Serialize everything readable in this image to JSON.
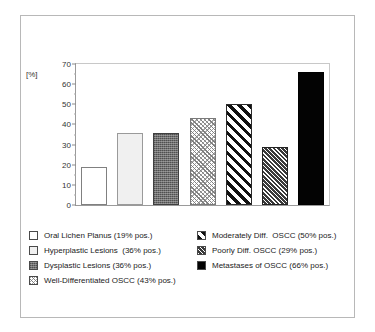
{
  "figure": {
    "y_axis_title": "[%]"
  },
  "chart_data": {
    "type": "bar",
    "title": "",
    "xlabel": "",
    "ylabel": "[%]",
    "ylim": [
      0,
      70
    ],
    "ytick_labels": [
      "0",
      "10",
      "20",
      "30",
      "40",
      "50",
      "60",
      "70"
    ],
    "ytick_values": [
      0,
      10,
      20,
      30,
      40,
      50,
      60,
      70
    ],
    "minor_tick_interval": 5,
    "grid": false,
    "legend_position": "below",
    "categories": [
      "Oral Lichen Planus",
      "Hyperplastic Lesions",
      "Dysplastic Lesions",
      "Well-Differentiated OSCC",
      "Moderately Diff. OSCC",
      "Poorly Diff. OSCC",
      "Metastases of OSCC"
    ],
    "values": [
      19,
      36,
      36,
      43,
      50,
      29,
      66
    ],
    "bar_fills": [
      "white",
      "light-gray",
      "dark-gray-stipple",
      "light-diagonal-hatch",
      "bold-diagonal-hatch",
      "dense-diagonal-hatch",
      "solid-black"
    ]
  },
  "legend": {
    "left_column": [
      {
        "swatch": "swatch-white",
        "label": "Oral Lichen Planus (19% pos.)"
      },
      {
        "swatch": "swatch-lightgray",
        "label": "Hyperplastic Lesions  (36% pos.)"
      },
      {
        "swatch": "swatch-darkgray",
        "label": "Dysplastic Lesions (36% pos.)"
      },
      {
        "swatch": "swatch-lighthatch",
        "label": "Well-Differentiated OSCC (43% pos.)"
      }
    ],
    "right_column": [
      {
        "swatch": "swatch-boldhatch",
        "label": "Moderately Diff.  OSCC (50% pos.)"
      },
      {
        "swatch": "swatch-densehatch",
        "label": "Poorly Diff. OSCC (29% pos.)"
      },
      {
        "swatch": "swatch-black",
        "label": "Metastases of OSCC (66% pos.)"
      }
    ]
  },
  "colors": {
    "frame_border": "#b8b8b8",
    "axis": "#9a9a9a",
    "bar_outline": "#4a4a4a",
    "text": "#222222"
  }
}
